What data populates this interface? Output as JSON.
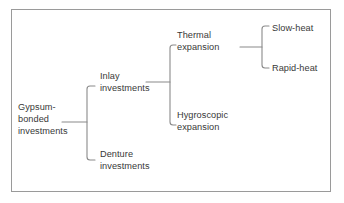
{
  "diagram": {
    "type": "tree",
    "line_color": "#8a8a8a",
    "text_color": "#383838",
    "border_color": "#9a9a9a",
    "background": "#ffffff",
    "nodes": {
      "root": "Gypsum-\nbonded\ninvestments",
      "inlay": "Inlay\ninvestments",
      "denture": "Denture\ninvestments",
      "thermal": "Thermal\nexpansion",
      "hygroscopic": "Hygroscopic\nexpansion",
      "slow_heat": "Slow-heat",
      "rapid_heat": "Rapid-heat"
    },
    "edges": [
      {
        "from": "root",
        "to": "inlay"
      },
      {
        "from": "root",
        "to": "denture"
      },
      {
        "from": "inlay",
        "to": "thermal"
      },
      {
        "from": "inlay",
        "to": "hygroscopic"
      },
      {
        "from": "thermal",
        "to": "slow_heat"
      },
      {
        "from": "thermal",
        "to": "rapid_heat"
      }
    ]
  }
}
